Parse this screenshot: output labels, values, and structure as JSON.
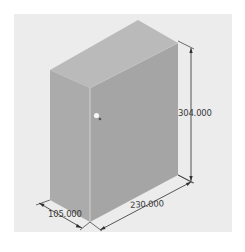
{
  "diagram": {
    "type": "isometric-3d-model",
    "colors": {
      "background": "#ececec",
      "top_face": "#b9b9b9",
      "left_face": "#a9a9a9",
      "right_face": "#a3a3a3",
      "edge_highlight": "#cfcfcf",
      "dimension_line": "#2f2f2f",
      "handle": "#f4f4f4"
    },
    "dimensions": {
      "height": "304.000",
      "width": "230.000",
      "depth": "105.000"
    }
  }
}
